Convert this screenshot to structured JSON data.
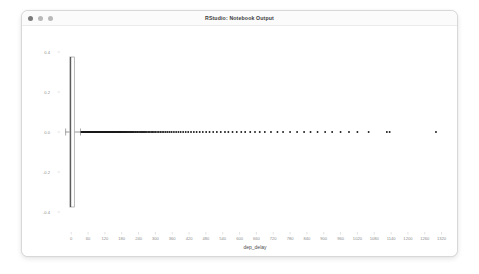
{
  "window": {
    "title": "RStudio: Notebook Output",
    "controls": [
      {
        "name": "close",
        "color": "#7a7a7a"
      },
      {
        "name": "minimize",
        "color": "#b9b9b9"
      },
      {
        "name": "maximize",
        "color": "#b9b9b9"
      }
    ]
  },
  "chart_data": {
    "type": "boxplot",
    "title": "",
    "xlabel": "dep_delay",
    "ylabel": "",
    "orientation": "horizontal",
    "grid": false,
    "legend": null,
    "xlim": [
      -40,
      1350
    ],
    "ylim": [
      -0.5,
      0.5
    ],
    "xticks": [
      0,
      60,
      120,
      180,
      240,
      300,
      360,
      420,
      480,
      540,
      600,
      660,
      720,
      780,
      840,
      900,
      960,
      1020,
      1080,
      1140,
      1200,
      1260,
      1320
    ],
    "xticklabels": [
      "0",
      "60",
      "120",
      "180",
      "240",
      "300",
      "360",
      "420",
      "480",
      "540",
      "600",
      "660",
      "720",
      "780",
      "840",
      "900",
      "960",
      "1020",
      "1080",
      "1140",
      "1200",
      "1260",
      "1320"
    ],
    "yticks": [
      0.4,
      0.2,
      0.0,
      -0.2,
      -0.4
    ],
    "yticklabels": [
      "0.4",
      "0.2",
      "0.0",
      "-0.2",
      "-0.4"
    ],
    "box": {
      "whisker_low": -20,
      "q1": -5,
      "median": -2,
      "q3": 11,
      "whisker_high": 33,
      "box_y_low": -0.375,
      "box_y_high": 0.375
    },
    "outliers": [
      36,
      38,
      40,
      42,
      44,
      45,
      47,
      48,
      50,
      51,
      53,
      54,
      56,
      57,
      58,
      60,
      61,
      62,
      64,
      65,
      66,
      68,
      69,
      70,
      72,
      73,
      74,
      76,
      77,
      78,
      80,
      81,
      82,
      84,
      85,
      86,
      88,
      89,
      90,
      92,
      93,
      95,
      96,
      97,
      99,
      100,
      102,
      103,
      105,
      106,
      108,
      109,
      111,
      112,
      114,
      115,
      117,
      118,
      120,
      122,
      123,
      125,
      126,
      128,
      130,
      131,
      133,
      135,
      136,
      138,
      140,
      141,
      143,
      145,
      147,
      148,
      150,
      152,
      154,
      156,
      158,
      160,
      162,
      164,
      166,
      168,
      170,
      172,
      174,
      176,
      178,
      180,
      183,
      185,
      187,
      190,
      192,
      195,
      197,
      200,
      203,
      206,
      209,
      212,
      215,
      218,
      221,
      224,
      228,
      231,
      235,
      238,
      242,
      246,
      250,
      254,
      258,
      262,
      266,
      270,
      275,
      280,
      285,
      290,
      295,
      300,
      306,
      312,
      318,
      324,
      330,
      337,
      344,
      351,
      358,
      366,
      374,
      382,
      390,
      399,
      408,
      417,
      427,
      437,
      447,
      458,
      469,
      481,
      493,
      506,
      519,
      533,
      548,
      560,
      575,
      590,
      606,
      620,
      638,
      655,
      672,
      690,
      712,
      735,
      755,
      780,
      805,
      830,
      853,
      878,
      905,
      930,
      960,
      990,
      1020,
      1060,
      1125,
      1135,
      1300
    ],
    "outlier_y": 0.0
  }
}
